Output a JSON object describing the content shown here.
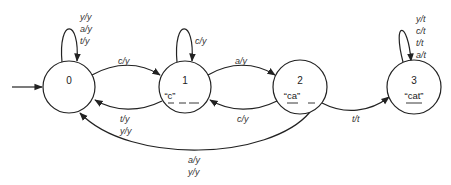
{
  "diagram": {
    "type": "finite-state-transducer",
    "states": [
      {
        "id": "0",
        "label": "0",
        "string": ""
      },
      {
        "id": "1",
        "label": "1",
        "string": "“c”",
        "blanks": 2
      },
      {
        "id": "2",
        "label": "2",
        "string": "“ca”",
        "blanks": 1
      },
      {
        "id": "3",
        "label": "3",
        "string": "“cat”",
        "blanks": 0
      }
    ],
    "start_state": "0",
    "transitions": [
      {
        "from": "0",
        "to": "0",
        "labels": [
          "y/y",
          "a/y",
          "t/y"
        ]
      },
      {
        "from": "0",
        "to": "1",
        "labels": [
          "c/y"
        ]
      },
      {
        "from": "1",
        "to": "1",
        "labels": [
          "c/y"
        ]
      },
      {
        "from": "1",
        "to": "0",
        "labels": [
          "t/y",
          "y/y"
        ]
      },
      {
        "from": "1",
        "to": "2",
        "labels": [
          "a/y"
        ]
      },
      {
        "from": "2",
        "to": "1",
        "labels": [
          "c/y"
        ]
      },
      {
        "from": "2",
        "to": "3",
        "labels": [
          "t/t"
        ]
      },
      {
        "from": "2",
        "to": "0",
        "labels": [
          "a/y",
          "y/y"
        ]
      },
      {
        "from": "3",
        "to": "3",
        "labels": [
          "y/t",
          "c/t",
          "t/t",
          "a/t"
        ]
      }
    ]
  }
}
